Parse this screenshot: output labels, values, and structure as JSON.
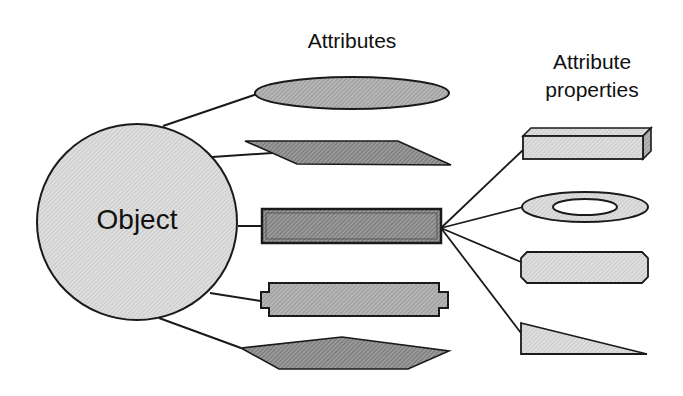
{
  "diagram": {
    "object": {
      "label": "Object",
      "shape": "circle"
    },
    "attributes_heading": "Attributes",
    "properties_heading": {
      "line1": "Attribute",
      "line2": "properties"
    },
    "attributes": [
      {
        "shape": "ellipse"
      },
      {
        "shape": "parallelogram"
      },
      {
        "shape": "bar",
        "highlighted": true
      },
      {
        "shape": "notched-rectangle"
      },
      {
        "shape": "hexagon"
      }
    ],
    "attribute_properties": [
      {
        "shape": "3d-box"
      },
      {
        "shape": "ring"
      },
      {
        "shape": "octagon"
      },
      {
        "shape": "right-triangle"
      }
    ],
    "colors": {
      "stroke": "#1a1a1a",
      "light_fill": "#d4d4d4",
      "medium_fill": "#a9a9a9",
      "dark_fill": "#8a8a8a",
      "background": "#ffffff"
    }
  }
}
